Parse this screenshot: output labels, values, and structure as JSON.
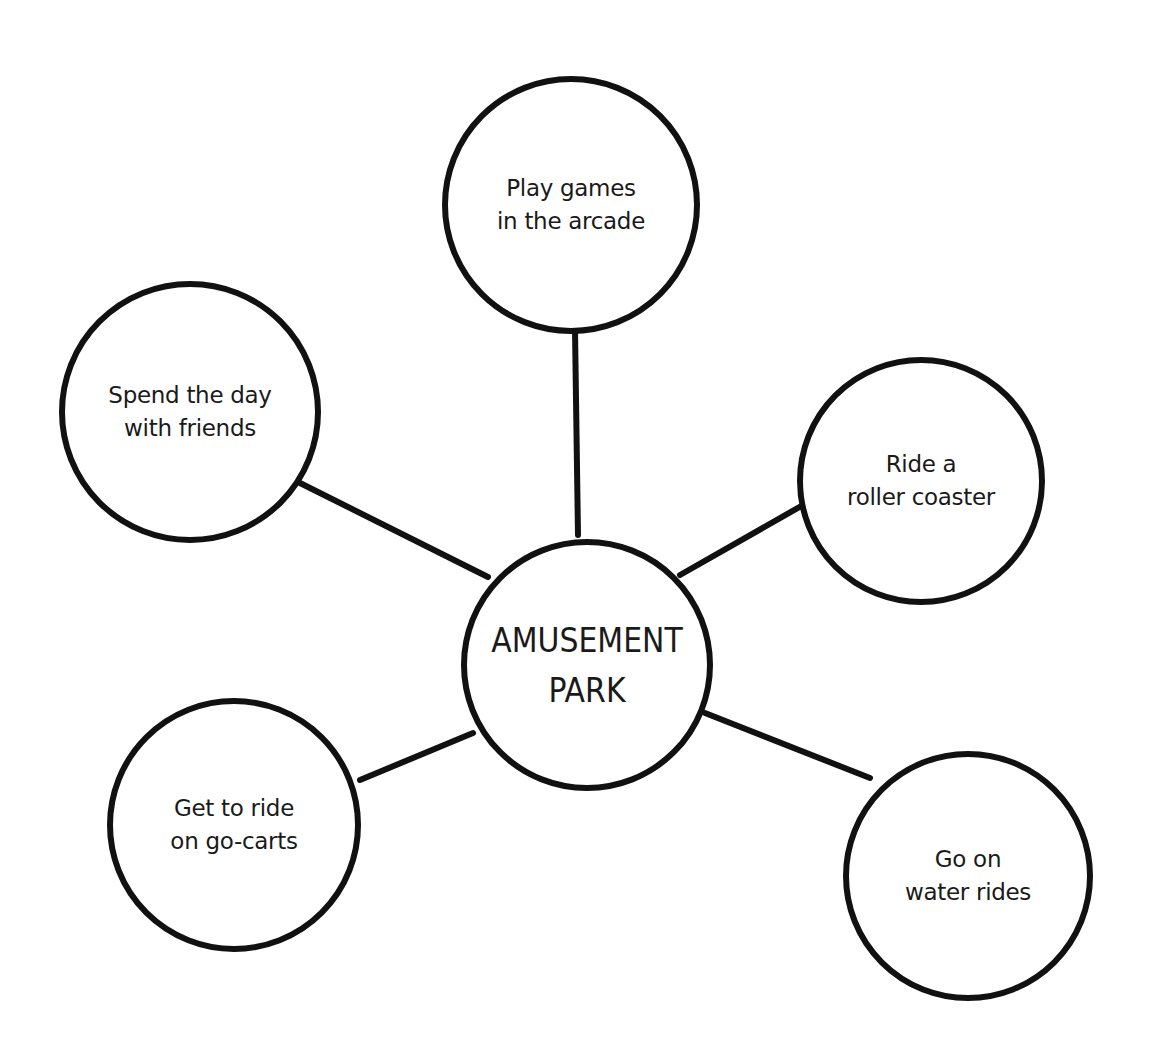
{
  "diagram": {
    "type": "bubble map",
    "stroke_color": "#111111",
    "background_color": "#ffffff",
    "center": {
      "lines": [
        "AMUSEMENT",
        "PARK"
      ],
      "cx": 587,
      "cy": 665,
      "r": 123
    },
    "nodes": [
      {
        "id": "arcade",
        "lines": [
          "Play games",
          "in the arcade"
        ],
        "cx": 571,
        "cy": 205,
        "r": 126
      },
      {
        "id": "friends",
        "lines": [
          "Spend the day",
          "with friends"
        ],
        "cx": 190,
        "cy": 412,
        "r": 128
      },
      {
        "id": "roller-coaster",
        "lines": [
          "Ride a",
          "roller coaster"
        ],
        "cx": 921,
        "cy": 481,
        "r": 121
      },
      {
        "id": "go-carts",
        "lines": [
          "Get to ride",
          "on go-carts"
        ],
        "cx": 234,
        "cy": 825,
        "r": 124
      },
      {
        "id": "water-rides",
        "lines": [
          "Go on",
          "water rides"
        ],
        "cx": 968,
        "cy": 876,
        "r": 122
      }
    ],
    "connectors": [
      {
        "from": "center",
        "to": "arcade",
        "x1": 578,
        "y1": 535,
        "x2": 575,
        "y2": 330
      },
      {
        "from": "center",
        "to": "friends",
        "x1": 488,
        "y1": 577,
        "x2": 300,
        "y2": 483
      },
      {
        "from": "center",
        "to": "roller-coaster",
        "x1": 680,
        "y1": 575,
        "x2": 803,
        "y2": 505
      },
      {
        "from": "center",
        "to": "go-carts",
        "x1": 473,
        "y1": 733,
        "x2": 360,
        "y2": 780
      },
      {
        "from": "center",
        "to": "water-rides",
        "x1": 705,
        "y1": 713,
        "x2": 870,
        "y2": 778
      }
    ]
  }
}
